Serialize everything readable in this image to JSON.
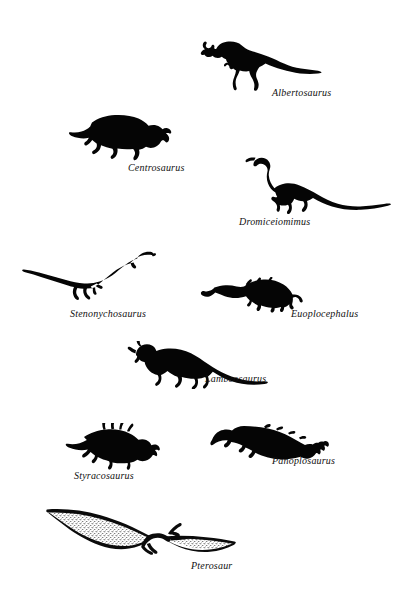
{
  "plate": {
    "title": "Dinosaur silhouette plate",
    "background_color": "#ffffff",
    "ink_color": "#050505",
    "width": 394,
    "height": 592
  },
  "figures": [
    {
      "id": "albertosaurus",
      "label": "Albertosaurus",
      "icon": "albertosaurus-silhouette",
      "group": "theropod",
      "facing": "left",
      "silhouette_box": {
        "x": 200,
        "y": 36,
        "w": 122,
        "h": 58
      },
      "label_box": {
        "x": 272,
        "y": 88,
        "w": 80,
        "h": 14
      },
      "label_font_size": 10
    },
    {
      "id": "centrosaurus",
      "label": "Centrosaurus",
      "icon": "centrosaurus-silhouette",
      "group": "ceratopsian",
      "facing": "right",
      "silhouette_box": {
        "x": 68,
        "y": 112,
        "w": 104,
        "h": 50
      },
      "label_box": {
        "x": 128,
        "y": 163,
        "w": 76,
        "h": 14
      },
      "label_font_size": 10
    },
    {
      "id": "dromiceiomimus",
      "label": "Dromiceiomimus",
      "icon": "dromiceiomimus-silhouette",
      "group": "ornithomimid",
      "facing": "left",
      "silhouette_box": {
        "x": 244,
        "y": 152,
        "w": 148,
        "h": 62
      },
      "label_box": {
        "x": 239,
        "y": 217,
        "w": 92,
        "h": 14
      },
      "label_font_size": 10
    },
    {
      "id": "stenonychosaurus",
      "label": "Stenonychosaurus",
      "icon": "stenonychosaurus-silhouette",
      "group": "troodontid",
      "facing": "right",
      "silhouette_box": {
        "x": 22,
        "y": 248,
        "w": 134,
        "h": 58
      },
      "label_box": {
        "x": 70,
        "y": 309,
        "w": 98,
        "h": 14
      },
      "label_font_size": 10
    },
    {
      "id": "euoplocephalus",
      "label": "Euoplocephalus",
      "icon": "euoplocephalus-silhouette",
      "group": "ankylosaur",
      "facing": "right",
      "silhouette_box": {
        "x": 200,
        "y": 277,
        "w": 104,
        "h": 38
      },
      "label_box": {
        "x": 291,
        "y": 309,
        "w": 90,
        "h": 14
      },
      "label_font_size": 10
    },
    {
      "id": "lambeosaurus",
      "label": "Lambeosaurus",
      "icon": "lambeosaurus-silhouette",
      "group": "hadrosaur",
      "facing": "left",
      "silhouette_box": {
        "x": 118,
        "y": 341,
        "w": 150,
        "h": 48
      },
      "label_box": {
        "x": 205,
        "y": 374,
        "w": 82,
        "h": 14
      },
      "label_font_size": 10
    },
    {
      "id": "styracosaurus",
      "label": "Styracosaurus",
      "icon": "styracosaurus-silhouette",
      "group": "ceratopsian",
      "facing": "right",
      "silhouette_box": {
        "x": 58,
        "y": 423,
        "w": 110,
        "h": 48
      },
      "label_box": {
        "x": 74,
        "y": 471,
        "w": 80,
        "h": 14
      },
      "label_font_size": 10
    },
    {
      "id": "panoplosaurus",
      "label": "Panoplosaurus",
      "icon": "panoplosaurus-silhouette",
      "group": "nodosaur",
      "facing": "left",
      "silhouette_box": {
        "x": 204,
        "y": 424,
        "w": 126,
        "h": 38
      },
      "label_box": {
        "x": 272,
        "y": 456,
        "w": 84,
        "h": 14
      },
      "label_font_size": 10
    },
    {
      "id": "pterosaur",
      "label": "Pterosaur",
      "icon": "pterosaur-silhouette",
      "group": "pterosaur",
      "facing": "right",
      "silhouette_box": {
        "x": 44,
        "y": 503,
        "w": 192,
        "h": 54
      },
      "label_box": {
        "x": 191,
        "y": 561,
        "w": 62,
        "h": 14
      },
      "label_font_size": 10
    }
  ]
}
